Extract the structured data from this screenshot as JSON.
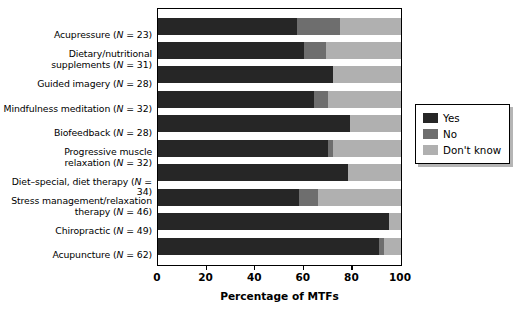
{
  "chart_data": {
    "type": "bar",
    "orientation": "horizontal",
    "stacked": true,
    "stack_mode": "percent",
    "title": "",
    "subtitle": "",
    "xlabel": "Percentage of MTFs",
    "ylabel": "",
    "xlim": [
      0,
      100
    ],
    "xticks": [
      0,
      20,
      40,
      60,
      80,
      100
    ],
    "xticklabels": [
      "0",
      "20",
      "40",
      "60",
      "80",
      "100"
    ],
    "grid": false,
    "legend_position": "right",
    "categories": [
      "Acupressure (N = 23)",
      "Dietary/nutritional supplements (N = 31)",
      "Guided imagery (N = 28)",
      "Mindfulness meditation (N = 32)",
      "Biofeedback (N = 28)",
      "Progressive muscle relaxation (N = 32)",
      "Diet–special, diet therapy (N = 34)",
      "Stress management/relaxation therapy (N = 46)",
      "Chiropractic (N = 49)",
      "Acupuncture (N = 62)"
    ],
    "category_lines": [
      [
        "Acupressure (",
        "N",
        " = 23)"
      ],
      [
        "Dietary/nutritional",
        "supplements (",
        "N",
        " = 31)"
      ],
      [
        "Guided imagery (",
        "N",
        " = 28)"
      ],
      [
        "Mindfulness meditation (",
        "N",
        " = 32)"
      ],
      [
        "Biofeedback (",
        "N",
        " = 28)"
      ],
      [
        "Progressive muscle",
        "relaxation (",
        "N",
        " = 32)"
      ],
      [
        "Diet–special, diet therapy (",
        "N",
        " = 34)"
      ],
      [
        "Stress management/relaxation",
        "therapy (",
        "N",
        " = 46)"
      ],
      [
        "Chiropractic (",
        "N",
        " = 49)"
      ],
      [
        "Acupuncture (",
        "N",
        " = 62)"
      ]
    ],
    "series": [
      {
        "name": "Yes",
        "color": "#262626",
        "values": [
          57,
          60,
          72,
          64,
          79,
          70,
          78,
          58,
          95,
          91
        ]
      },
      {
        "name": "No",
        "color": "#6e6e6e",
        "values": [
          18,
          9,
          0,
          6,
          0,
          2,
          0,
          8,
          0,
          2
        ]
      },
      {
        "name": "Don't know",
        "color": "#b0b0b0",
        "values": [
          25,
          31,
          28,
          30,
          21,
          28,
          22,
          34,
          5,
          7
        ]
      }
    ]
  },
  "axis": {
    "x_title": "Percentage of MTFs",
    "tick_labels": [
      "0",
      "20",
      "40",
      "60",
      "80",
      "100"
    ],
    "tick_values": [
      0,
      20,
      40,
      60,
      80,
      100
    ]
  },
  "legend": {
    "items": [
      {
        "label": "Yes",
        "color": "#262626"
      },
      {
        "label": "No",
        "color": "#6e6e6e"
      },
      {
        "label": "Don't know",
        "color": "#b0b0b0"
      }
    ]
  },
  "colors": {
    "yes": "#262626",
    "no": "#6e6e6e",
    "dont_know": "#b0b0b0",
    "frame": "#000000",
    "background": "#ffffff"
  }
}
